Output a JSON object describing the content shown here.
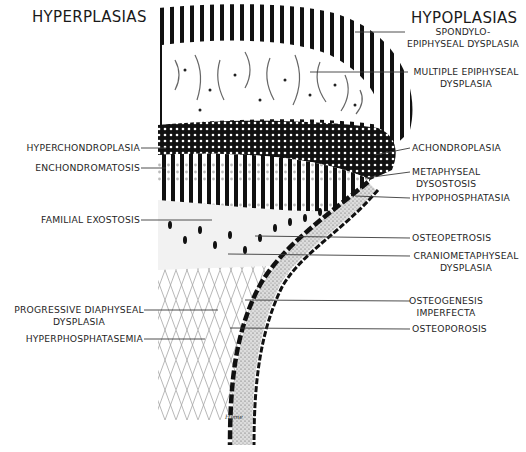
{
  "figure": {
    "left_heading": "HYPERPLASIAS",
    "right_heading": "HYPOPLASIAS",
    "left_labels": [
      {
        "id": "hyperchondroplasia",
        "text": "HYPERCHONDROPLASIA"
      },
      {
        "id": "enchondromatosis",
        "text": "ENCHONDROMATOSIS"
      },
      {
        "id": "familial-exostosis",
        "text": "FAMILIAL EXOSTOSIS"
      },
      {
        "id": "progressive-diaphyseal-dysplasia",
        "line1": "PROGRESSIVE DIAPHYSEAL",
        "line2": "DYSPLASIA"
      },
      {
        "id": "hyperphosphatasemia",
        "text": "HYPERPHOSPHATASEMIA"
      }
    ],
    "right_labels": [
      {
        "id": "spondyloepiphyseal-dysplasia",
        "line1": "SPONDYLO-",
        "line2": "EPIPHYSEAL DYSPLASIA"
      },
      {
        "id": "multiple-epiphyseal-dysplasia",
        "line1": "MULTIPLE EPIPHYSEAL",
        "line2": "DYSPLASIA"
      },
      {
        "id": "achondroplasia",
        "text": "ACHONDROPLASIA"
      },
      {
        "id": "metaphyseal-dysostosis",
        "line1": "METAPHYSEAL",
        "line2": "DYSOSTOSIS"
      },
      {
        "id": "hypophosphatasia",
        "text": "HYPOPHOSPHATASIA"
      },
      {
        "id": "osteopetrosis",
        "text": "OSTEOPETROSIS"
      },
      {
        "id": "craniometaphyseal-dysplasia",
        "line1": "CRANIOMETAPHYSEAL",
        "line2": "DYSPLASIA"
      },
      {
        "id": "osteogenesis-imperfecta",
        "line1": "OSTEOGENESIS",
        "line2": "IMPERFECTA"
      },
      {
        "id": "osteoporosis",
        "text": "OSTEOPOROSIS"
      }
    ],
    "signature": "Hyme",
    "colors": {
      "ink": "#111111",
      "paper": "#ffffff",
      "leader": "#3a3a3a",
      "spongy": "#cfcfcf"
    }
  }
}
